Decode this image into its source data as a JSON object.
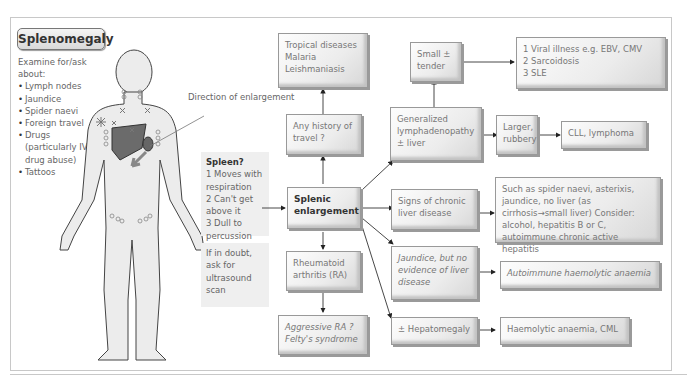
{
  "title": "Splenomegaly",
  "examine": {
    "heading": "Examine for/ask about:",
    "items": [
      "Lymph nodes",
      "Jaundice",
      "Spider naevi",
      "Foreign travel",
      "Drugs (particularly IV drug abuse)",
      "Tattoos"
    ]
  },
  "figure": {
    "direction_label": "Direction of enlargement"
  },
  "spleen_panel": {
    "heading": "Spleen?",
    "items": [
      "1 Moves with respiration",
      "2 Can't get above it",
      "3 Dull to percussion",
      "4 Notch felt"
    ]
  },
  "doubt_panel": {
    "text": "If in doubt, ask for ultrasound scan"
  },
  "nodes": {
    "tropical": "Tropical diseases Malaria Leishmaniasis",
    "travel": "Any history of travel ?",
    "splenic": "Splenic enlargement",
    "ra": "Rheumatoid arthritis (RA)",
    "aggressive_ra": "Aggressive RA ?Felty's syndrome",
    "small_tender": "Small ± tender",
    "viral": "1 Viral illness e.g. EBV, CMV\n2 Sarcoidosis\n3 SLE",
    "lymphadenopathy": "Generalized lymphadenopathy ± liver",
    "larger_rubbery": "Larger, rubbery",
    "cll": "CLL, lymphoma",
    "chronic_liver": "Signs of chronic liver disease",
    "chronic_detail": "Such as spider naevi, asterixis, jaundice, no liver (as cirrhosis→small liver) Consider: alcohol, hepatitis B or C, autoimmune chronic active hepatitis",
    "jaundice": "Jaundice, but no evidence of liver disease",
    "autoimmune": "Autoimmune haemolytic anaemia",
    "hepatomegaly": "± Hepatomegaly",
    "haemolytic": "Haemolytic anaemia, CML"
  }
}
